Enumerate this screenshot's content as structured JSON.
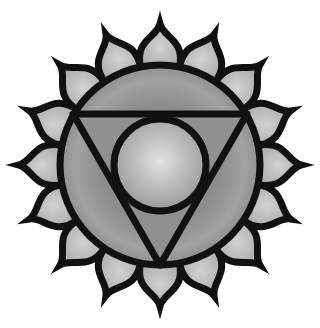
{
  "image": {
    "subject": "Throat chakra (Vishuddha) symbol",
    "width": 320,
    "height": 328,
    "background": "#ffffff"
  },
  "symbol": {
    "center": [
      160,
      165
    ],
    "petals": {
      "count": 16,
      "base_radius": 98,
      "tip_radius": 141,
      "half_angle_deg": 11.25,
      "fill": "#b4b4b4",
      "fill_light": "#d2d2d2"
    },
    "outer_circle": {
      "radius": 100,
      "fill": "#8c8c8c",
      "fill_light": "#a4a4a4"
    },
    "triangle": {
      "points": [
        [
          73,
          114
        ],
        [
          247,
          114
        ],
        [
          160,
          265
        ]
      ],
      "fill": "#909090"
    },
    "inner_circle": {
      "cx": 160,
      "cy": 165,
      "radius": 46,
      "fill": "#bdbdbd",
      "fill_light": "#dcdcdc"
    },
    "stroke": {
      "color": "#111111",
      "width": 7
    }
  }
}
